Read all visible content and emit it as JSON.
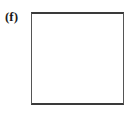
{
  "figure": {
    "panel_label": "(f)",
    "background_color": "#ffffff",
    "box": {
      "name": "empty-square",
      "fill_color": "#ffffff",
      "border_color": "#3a3a3a",
      "border_width_px": 2,
      "left_px": 31,
      "top_px": 12,
      "width_px": 93,
      "height_px": 93,
      "contents": ""
    }
  }
}
